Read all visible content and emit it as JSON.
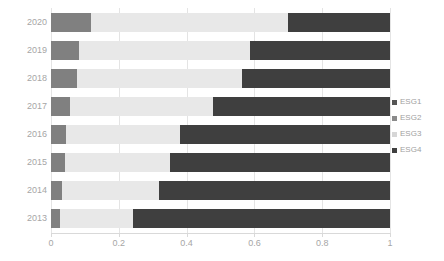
{
  "chart_data": {
    "type": "bar",
    "orientation": "horizontal",
    "stacked": true,
    "normalized": true,
    "title": "",
    "subtitle": "",
    "xlabel": "",
    "ylabel": "",
    "xlim": [
      0,
      1
    ],
    "xticks": [
      0,
      0.2,
      0.4,
      0.6,
      0.8,
      1
    ],
    "xtick_labels": [
      "0",
      "0.2",
      "0.4",
      "0.6",
      "0.8",
      "1"
    ],
    "grid": true,
    "grid_axis": "x",
    "legend_position": "right",
    "categories": [
      "2020",
      "2019",
      "2018",
      "2017",
      "2016",
      "2015",
      "2014",
      "2013"
    ],
    "series": [
      {
        "name": "ESG1",
        "color": "#808080",
        "values": [
          0.118,
          0.083,
          0.077,
          0.056,
          0.044,
          0.041,
          0.032,
          0.027
        ]
      },
      {
        "name": "ESG2",
        "color": "#e8e8e8",
        "values": [
          0.0,
          0.0,
          0.0,
          0.0,
          0.0,
          0.0,
          0.0,
          0.0
        ]
      },
      {
        "name": "ESG3",
        "color": "#e8e8e8",
        "values": [
          0.582,
          0.504,
          0.486,
          0.422,
          0.336,
          0.31,
          0.287,
          0.215
        ]
      },
      {
        "name": "ESG4",
        "color": "#3f3f3f",
        "values": [
          0.3,
          0.413,
          0.437,
          0.522,
          0.62,
          0.649,
          0.681,
          0.758
        ]
      }
    ]
  },
  "legend": {
    "items": [
      {
        "label": "ESG1",
        "color": "#555555"
      },
      {
        "label": "ESG2",
        "color": "#8a8a8a"
      },
      {
        "label": "ESG3",
        "color": "#d6d6d6"
      },
      {
        "label": "ESG4",
        "color": "#3f3f3f"
      }
    ]
  },
  "axis": {
    "x_tick_labels": [
      "0",
      "0.2",
      "0.4",
      "0.6",
      "0.8",
      "1"
    ],
    "y_tick_labels": [
      "2020",
      "2019",
      "2018",
      "2017",
      "2016",
      "2015",
      "2014",
      "2013"
    ]
  }
}
